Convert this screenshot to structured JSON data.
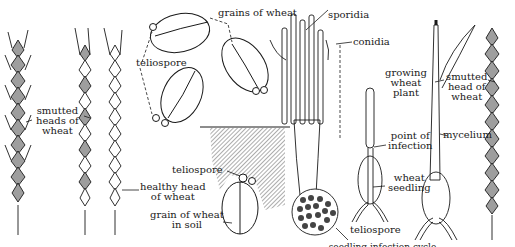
{
  "colors": {
    "ink": "#1a1a1a",
    "smut_fill": "#9e9e9e",
    "soil_hatch": "#8a8a8a",
    "background": "#ffffff"
  },
  "labels": {
    "smutted_heads": [
      "smutted",
      "heads of",
      "wheat"
    ],
    "healthy_head": [
      "healthy head",
      "of wheat"
    ],
    "grains_of_wheat": "grains of wheat",
    "teliospore_top": "teliospore",
    "teliospore_soil": "teliospore",
    "grain_in_soil": [
      "grain of wheat",
      "in soil"
    ],
    "sporidia": "sporidia",
    "conidia": "conidia",
    "teliospore_germinating": "teliospore",
    "point_of_infection": [
      "point of",
      "infection"
    ],
    "wheat_seedling": [
      "wheat",
      "seedling"
    ],
    "growing_wheat_plant": [
      "growing",
      "wheat",
      "plant"
    ],
    "mycelium": "mycelium",
    "smutted_head_right": [
      "smutted",
      "head of",
      "wheat"
    ]
  },
  "caption": "seedling infection cycle"
}
